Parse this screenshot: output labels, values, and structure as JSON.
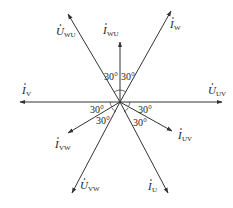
{
  "diagram": {
    "center": [
      120,
      102
    ],
    "vectors": [
      {
        "id": "U_UV",
        "symbol": "U",
        "subscript": "UV",
        "tip": [
          222,
          102
        ],
        "label_pos": [
          208,
          94
        ]
      },
      {
        "id": "I_V",
        "symbol": "I",
        "subscript": "V",
        "tip": [
          20,
          102
        ],
        "label_pos": [
          22,
          94
        ]
      },
      {
        "id": "U_WU",
        "symbol": "U",
        "subscript": "WU",
        "tip": [
          68,
          14
        ],
        "label_pos": [
          56,
          35
        ]
      },
      {
        "id": "I_WU",
        "symbol": "I",
        "subscript": "WU",
        "tip": [
          120,
          42
        ],
        "label_pos": [
          103,
          34
        ]
      },
      {
        "id": "I_W",
        "symbol": "I",
        "subscript": "W",
        "tip": [
          171,
          11
        ],
        "label_pos": [
          170,
          28
        ]
      },
      {
        "id": "I_VW",
        "symbol": "I",
        "subscript": "VW",
        "tip": [
          68,
          133
        ],
        "label_pos": [
          55,
          148
        ]
      },
      {
        "id": "U_VW",
        "symbol": "U",
        "subscript": "VW",
        "tip": [
          72,
          193
        ],
        "label_pos": [
          80,
          189
        ]
      },
      {
        "id": "I_UV",
        "symbol": "I",
        "subscript": "UV",
        "tip": [
          172,
          131
        ],
        "label_pos": [
          178,
          139
        ]
      },
      {
        "id": "I_U",
        "symbol": "I",
        "subscript": "U",
        "tip": [
          168,
          193
        ],
        "label_pos": [
          148,
          190
        ]
      }
    ],
    "angles": [
      {
        "text": "30°",
        "pos": [
          104,
          80
        ]
      },
      {
        "text": "30°",
        "pos": [
          121,
          80
        ]
      },
      {
        "text": "30°",
        "pos": [
          90,
          113
        ]
      },
      {
        "text": "30°",
        "pos": [
          138,
          113
        ]
      },
      {
        "text": "30°",
        "pos": [
          96,
          124
        ]
      },
      {
        "text": "30°",
        "pos": [
          133,
          126
        ]
      }
    ]
  }
}
